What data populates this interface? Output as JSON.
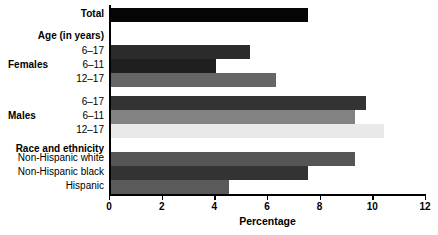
{
  "chart_data": {
    "type": "bar",
    "orientation": "horizontal",
    "title": "",
    "xlabel": "Percentage",
    "ylabel": "",
    "xlim": [
      0,
      12
    ],
    "xticks": [
      0,
      2,
      4,
      6,
      8,
      10,
      12
    ],
    "xticklabels": [
      "0",
      "2",
      "4",
      "6",
      "8",
      "10",
      "12"
    ],
    "grid": false,
    "legend": null,
    "categories": [
      "Total",
      "Age (in years)",
      "Females 6-17",
      "Females 6-11",
      "Females 12-17",
      "Males 6-17",
      "Males 6-11",
      "Males 12-17",
      "Race and ethnicity",
      "Non-Hispanic white",
      "Non-Hispanic black",
      "Hispanic"
    ],
    "values": [
      7.5,
      null,
      5.3,
      4.0,
      6.3,
      9.7,
      9.3,
      10.4,
      null,
      9.3,
      7.5,
      4.5
    ]
  },
  "rows": [
    {
      "label": "Total",
      "bold": true,
      "group": "",
      "value": 7.5,
      "color": "#050505",
      "top": 8,
      "is_header": false
    },
    {
      "label": "Age (in years)",
      "bold": true,
      "group": "",
      "value": null,
      "color": "",
      "top": 30,
      "is_header": true
    },
    {
      "label": "6–17",
      "bold": false,
      "group": "",
      "value": 5.3,
      "color": "#2b2b2b",
      "top": 45,
      "is_header": false
    },
    {
      "label": "6–11",
      "bold": false,
      "group": "Females",
      "value": 4.0,
      "color": "#1f1f1f",
      "top": 59,
      "is_header": false
    },
    {
      "label": "12–17",
      "bold": false,
      "group": "",
      "value": 6.3,
      "color": "#666666",
      "top": 73,
      "is_header": false
    },
    {
      "label": "6–17",
      "bold": false,
      "group": "",
      "value": 9.7,
      "color": "#333333",
      "top": 96,
      "is_header": false
    },
    {
      "label": "6–11",
      "bold": false,
      "group": "Males",
      "value": 9.3,
      "color": "#828282",
      "top": 110,
      "is_header": false
    },
    {
      "label": "12–17",
      "bold": false,
      "group": "",
      "value": 10.4,
      "color": "#e9e9e9",
      "top": 124,
      "is_header": false
    },
    {
      "label": "Race and ethnicity",
      "bold": true,
      "group": "",
      "value": null,
      "color": "",
      "top": 143,
      "is_header": true
    },
    {
      "label": "Non-Hispanic white",
      "bold": false,
      "group": "",
      "value": 9.3,
      "color": "#555555",
      "top": 152,
      "is_header": false
    },
    {
      "label": "Non-Hispanic black",
      "bold": false,
      "group": "",
      "value": 7.5,
      "color": "#333333",
      "top": 166,
      "is_header": false
    },
    {
      "label": "Hispanic",
      "bold": false,
      "group": "",
      "value": 4.5,
      "color": "#5a5a5a",
      "top": 180,
      "is_header": false
    }
  ],
  "groups": [
    {
      "label": "Females",
      "top": 59
    },
    {
      "label": "Males",
      "top": 110
    }
  ],
  "axis": {
    "title": "Percentage",
    "ticks": [
      "0",
      "2",
      "4",
      "6",
      "8",
      "10",
      "12"
    ]
  }
}
